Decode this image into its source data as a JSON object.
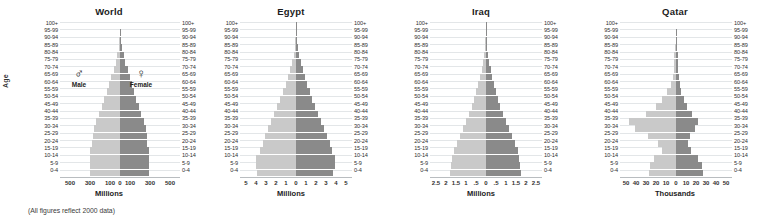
{
  "figure": {
    "age_axis_label": "Age",
    "footnote": "(All figures reflect 2000 data)",
    "legend": {
      "male": {
        "symbol": "♂",
        "label": "Male",
        "color": "#c9c9c9",
        "icon": "mars-symbol-icon"
      },
      "female": {
        "symbol": "♀",
        "label": "Female",
        "color": "#8a8a8a",
        "icon": "venus-symbol-icon"
      }
    }
  },
  "age_groups": [
    "100+",
    "95-99",
    "90-94",
    "85-89",
    "80-84",
    "75-79",
    "70-74",
    "65-69",
    "60-64",
    "55-59",
    "50-54",
    "45-49",
    "40-44",
    "35-39",
    "30-34",
    "25-29",
    "20-24",
    "15-19",
    "10-14",
    "5-9",
    "0-4"
  ],
  "chart_data": [
    {
      "type": "bar",
      "title": "World",
      "subtype": "population-pyramid",
      "xlabel": "Millions",
      "ylabel": "Age",
      "unit": "Millions",
      "xlim": [
        -600,
        600
      ],
      "xticks": [
        "500",
        "300",
        "100",
        "0",
        "100",
        "300",
        "500"
      ],
      "xtick_values": [
        -500,
        -300,
        -100,
        0,
        100,
        300,
        500
      ],
      "grid": true,
      "categories": [
        "100+",
        "95-99",
        "90-94",
        "85-89",
        "80-84",
        "75-79",
        "70-74",
        "65-69",
        "60-64",
        "55-59",
        "50-54",
        "45-49",
        "40-44",
        "35-39",
        "30-34",
        "25-29",
        "20-24",
        "15-19",
        "10-14",
        "5-9",
        "0-4"
      ],
      "series": [
        {
          "name": "Male",
          "values": [
            0.3,
            2,
            6,
            14,
            26,
            42,
            64,
            88,
            110,
            132,
            158,
            184,
            210,
            240,
            262,
            272,
            282,
            300,
            305,
            300,
            303
          ]
        },
        {
          "name": "Female",
          "values": [
            0.7,
            4,
            11,
            22,
            37,
            55,
            77,
            99,
            119,
            139,
            163,
            188,
            212,
            240,
            260,
            268,
            274,
            288,
            291,
            287,
            289
          ]
        }
      ]
    },
    {
      "type": "bar",
      "title": "Egypt",
      "subtype": "population-pyramid",
      "xlabel": "Millions",
      "ylabel": "Age",
      "unit": "Millions",
      "xlim": [
        -5.6,
        5.6
      ],
      "xticks": [
        "5",
        "4",
        "3",
        "2",
        "1",
        "0",
        "1",
        "2",
        "3",
        "4",
        "5"
      ],
      "xtick_values": [
        -5,
        -4,
        -3,
        -2,
        -1,
        0,
        1,
        2,
        3,
        4,
        5
      ],
      "grid": true,
      "categories": [
        "100+",
        "95-99",
        "90-94",
        "85-89",
        "80-84",
        "75-79",
        "70-74",
        "65-69",
        "60-64",
        "55-59",
        "50-54",
        "45-49",
        "40-44",
        "35-39",
        "30-34",
        "25-29",
        "20-24",
        "15-19",
        "10-14",
        "5-9",
        "0-4"
      ],
      "series": [
        {
          "name": "Male",
          "values": [
            0.01,
            0.03,
            0.07,
            0.14,
            0.25,
            0.4,
            0.6,
            0.82,
            1.05,
            1.3,
            1.6,
            1.9,
            2.2,
            2.5,
            2.8,
            3.1,
            3.35,
            3.6,
            4.0,
            4.0,
            3.9
          ]
        },
        {
          "name": "Female",
          "values": [
            0.01,
            0.04,
            0.09,
            0.17,
            0.29,
            0.45,
            0.65,
            0.87,
            1.1,
            1.35,
            1.62,
            1.9,
            2.2,
            2.5,
            2.8,
            3.1,
            3.35,
            3.6,
            3.85,
            3.85,
            3.7
          ]
        }
      ]
    },
    {
      "type": "bar",
      "title": "Iraq",
      "subtype": "population-pyramid",
      "xlabel": "Millions",
      "ylabel": "Age",
      "unit": "Millions",
      "xlim": [
        -2.8,
        2.8
      ],
      "xticks": [
        "2.5",
        "2",
        "1.5",
        "1",
        ".5",
        "0",
        ".5",
        "1",
        "1.5",
        "2",
        "2.5"
      ],
      "xtick_values": [
        -2.5,
        -2,
        -1.5,
        -1,
        -0.5,
        0,
        0.5,
        1,
        1.5,
        2,
        2.5
      ],
      "grid": true,
      "categories": [
        "100+",
        "95-99",
        "90-94",
        "85-89",
        "80-84",
        "75-79",
        "70-74",
        "65-69",
        "60-64",
        "55-59",
        "50-54",
        "45-49",
        "40-44",
        "35-39",
        "30-34",
        "25-29",
        "20-24",
        "15-19",
        "10-14",
        "5-9",
        "0-4"
      ],
      "series": [
        {
          "name": "Male",
          "values": [
            0.004,
            0.012,
            0.028,
            0.055,
            0.095,
            0.15,
            0.22,
            0.3,
            0.38,
            0.48,
            0.6,
            0.72,
            0.85,
            1.0,
            1.15,
            1.3,
            1.45,
            1.6,
            1.7,
            1.75,
            1.8
          ]
        },
        {
          "name": "Female",
          "values": [
            0.005,
            0.014,
            0.032,
            0.062,
            0.105,
            0.16,
            0.23,
            0.31,
            0.39,
            0.49,
            0.6,
            0.72,
            0.85,
            1.0,
            1.15,
            1.3,
            1.45,
            1.58,
            1.66,
            1.7,
            1.75
          ]
        }
      ]
    },
    {
      "type": "bar",
      "title": "Qatar",
      "subtype": "population-pyramid",
      "xlabel": "Thousands",
      "ylabel": "Age",
      "unit": "Thousands",
      "xlim": [
        -56,
        56
      ],
      "xticks": [
        "50",
        "40",
        "30",
        "20",
        "10",
        "0",
        "10",
        "20",
        "30",
        "40",
        "50"
      ],
      "xtick_values": [
        -50,
        -40,
        -30,
        -20,
        -10,
        0,
        10,
        20,
        30,
        40,
        50
      ],
      "grid": true,
      "categories": [
        "100+",
        "95-99",
        "90-94",
        "85-89",
        "80-84",
        "75-79",
        "70-74",
        "65-69",
        "60-64",
        "55-59",
        "50-54",
        "45-49",
        "40-44",
        "35-39",
        "30-34",
        "25-29",
        "20-24",
        "15-19",
        "10-14",
        "5-9",
        "0-4"
      ],
      "series": [
        {
          "name": "Male",
          "values": [
            0.05,
            0.2,
            0.5,
            1.0,
            1.6,
            1.9,
            2.2,
            3.0,
            5.5,
            9.0,
            14.0,
            20.0,
            30.0,
            47.0,
            41.0,
            28.0,
            18.0,
            14.0,
            22.0,
            26.0,
            27.0
          ]
        },
        {
          "name": "Female",
          "values": [
            0.05,
            0.2,
            0.5,
            1.0,
            1.6,
            1.9,
            2.2,
            2.6,
            3.5,
            5.0,
            7.5,
            11.0,
            16.0,
            22.0,
            19.0,
            14.0,
            12.0,
            15.0,
            22.0,
            25.5,
            26.5
          ]
        }
      ]
    }
  ]
}
